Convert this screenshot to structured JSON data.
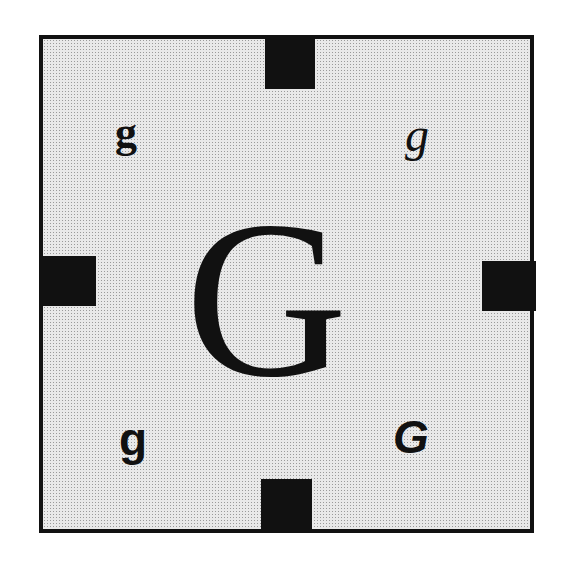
{
  "figure": {
    "background_pattern": "halftone-dots",
    "border_color": "#111111",
    "fill_color": "#e9e9e9",
    "tabs": [
      "top",
      "left",
      "right",
      "bottom"
    ],
    "center_letter": "G",
    "corner_letters": {
      "top_left": "g",
      "top_right": "g",
      "bottom_left": "g",
      "bottom_right": "G"
    },
    "corner_styles": {
      "top_left": "serif bold",
      "top_right": "serif italic",
      "bottom_left": "sans-serif bold",
      "bottom_right": "sans-serif bold italic"
    }
  }
}
